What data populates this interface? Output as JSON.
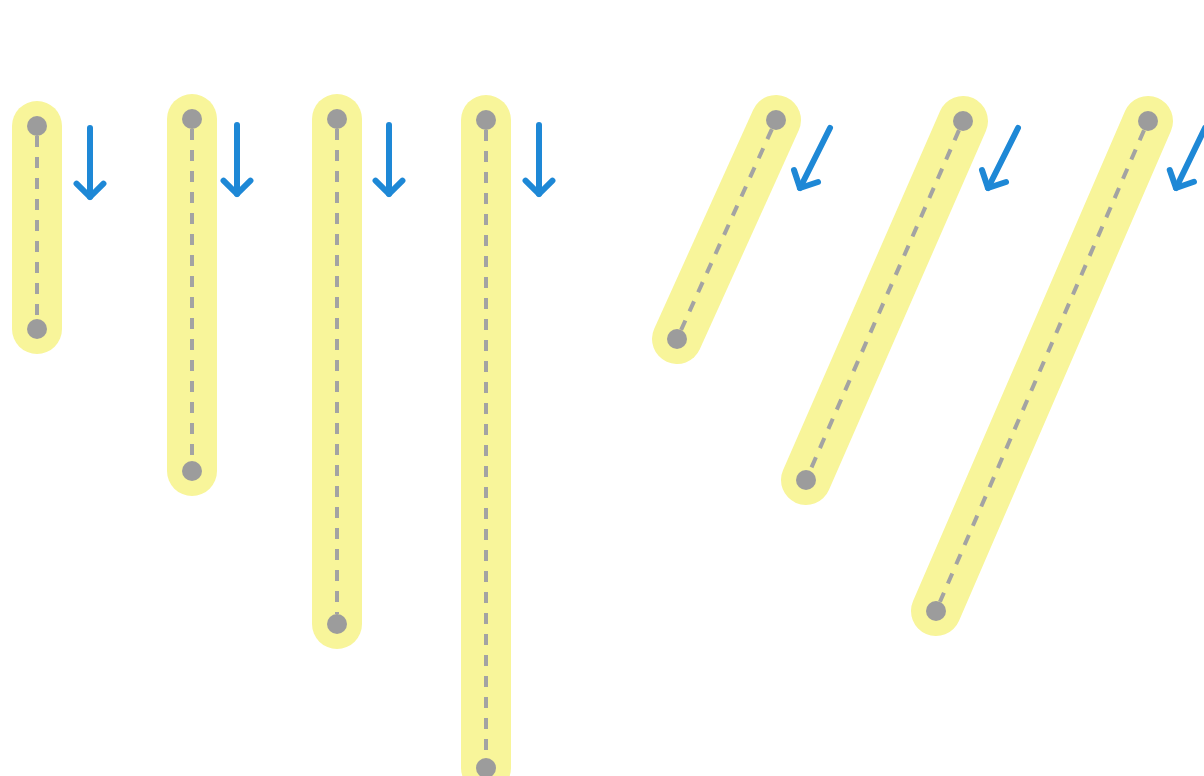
{
  "colors": {
    "background": "#ffffff",
    "highlight": "#f8f59a",
    "dot": "#9c9c9c",
    "dash": "#a3a3a3",
    "arrow": "#1e88d6"
  },
  "highlight_width": 50,
  "dot_radius": 10,
  "segments": [
    {
      "id": "vertical-1",
      "kind": "vertical",
      "x1": 37,
      "y1": 126,
      "x2": 37,
      "y2": 329
    },
    {
      "id": "vertical-2",
      "kind": "vertical",
      "x1": 192,
      "y1": 119,
      "x2": 192,
      "y2": 471
    },
    {
      "id": "vertical-3",
      "kind": "vertical",
      "x1": 337,
      "y1": 119,
      "x2": 337,
      "y2": 624
    },
    {
      "id": "vertical-4",
      "kind": "vertical",
      "x1": 486,
      "y1": 120,
      "x2": 486,
      "y2": 768
    },
    {
      "id": "diagonal-1",
      "kind": "diagonal",
      "x1": 776,
      "y1": 120,
      "x2": 677,
      "y2": 339
    },
    {
      "id": "diagonal-2",
      "kind": "diagonal",
      "x1": 963,
      "y1": 121,
      "x2": 806,
      "y2": 480
    },
    {
      "id": "diagonal-3",
      "kind": "diagonal",
      "x1": 1148,
      "y1": 121,
      "x2": 936,
      "y2": 611
    }
  ],
  "arrows": [
    {
      "id": "arrow-down-1",
      "direction": "down",
      "x1": 90,
      "y1": 128,
      "x2": 90,
      "y2": 197
    },
    {
      "id": "arrow-down-2",
      "direction": "down",
      "x1": 237,
      "y1": 125,
      "x2": 237,
      "y2": 194
    },
    {
      "id": "arrow-down-3",
      "direction": "down",
      "x1": 389,
      "y1": 125,
      "x2": 389,
      "y2": 194
    },
    {
      "id": "arrow-down-4",
      "direction": "down",
      "x1": 539,
      "y1": 125,
      "x2": 539,
      "y2": 194
    },
    {
      "id": "arrow-down-left-1",
      "direction": "down-left",
      "x1": 830,
      "y1": 128,
      "x2": 800,
      "y2": 188
    },
    {
      "id": "arrow-down-left-2",
      "direction": "down-left",
      "x1": 1018,
      "y1": 128,
      "x2": 988,
      "y2": 188
    },
    {
      "id": "arrow-down-left-3",
      "direction": "down-left",
      "x1": 1205,
      "y1": 128,
      "x2": 1176,
      "y2": 188
    }
  ]
}
